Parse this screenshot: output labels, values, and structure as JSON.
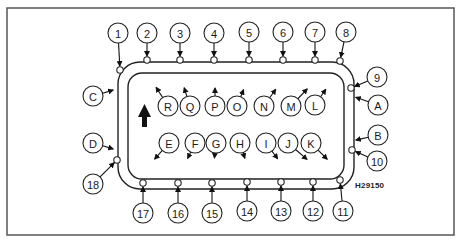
{
  "diagram": {
    "type": "cylinder head / sump bolt tightening sequence",
    "figure_code": "H29150",
    "direction_arrow": "up",
    "outer_numbers": [
      {
        "label": "1",
        "x": 118,
        "y": 33,
        "tx": 120,
        "ty": 70
      },
      {
        "label": "2",
        "x": 147,
        "y": 33,
        "tx": 147,
        "ty": 60
      },
      {
        "label": "3",
        "x": 180,
        "y": 33,
        "tx": 180,
        "ty": 60
      },
      {
        "label": "4",
        "x": 214,
        "y": 33,
        "tx": 214,
        "ty": 60
      },
      {
        "label": "5",
        "x": 249,
        "y": 32,
        "tx": 249,
        "ty": 60
      },
      {
        "label": "6",
        "x": 283,
        "y": 32,
        "tx": 283,
        "ty": 60
      },
      {
        "label": "7",
        "x": 315,
        "y": 32,
        "tx": 315,
        "ty": 60
      },
      {
        "label": "8",
        "x": 346,
        "y": 32,
        "tx": 340,
        "ty": 61
      },
      {
        "label": "9",
        "x": 377,
        "y": 77,
        "tx": 351,
        "ty": 88
      },
      {
        "label": "10",
        "x": 377,
        "y": 161,
        "tx": 352,
        "ty": 150
      },
      {
        "label": "11",
        "x": 343,
        "y": 211,
        "tx": 340,
        "ty": 180
      },
      {
        "label": "12",
        "x": 313,
        "y": 211,
        "tx": 313,
        "ty": 182
      },
      {
        "label": "13",
        "x": 281,
        "y": 211,
        "tx": 281,
        "ty": 182
      },
      {
        "label": "14",
        "x": 247,
        "y": 211,
        "tx": 247,
        "ty": 182
      },
      {
        "label": "15",
        "x": 212,
        "y": 213,
        "tx": 212,
        "ty": 183
      },
      {
        "label": "16",
        "x": 178,
        "y": 213,
        "tx": 178,
        "ty": 183
      },
      {
        "label": "17",
        "x": 143,
        "y": 213,
        "tx": 143,
        "ty": 183
      },
      {
        "label": "18",
        "x": 93,
        "y": 184,
        "tx": 117,
        "ty": 160
      }
    ],
    "inner_letters": [
      {
        "label": "A",
        "x": 378,
        "y": 105,
        "tx": 352,
        "ty": 96
      },
      {
        "label": "B",
        "x": 378,
        "y": 135,
        "tx": 352,
        "ty": 141
      },
      {
        "label": "C",
        "x": 93,
        "y": 96,
        "tx": 117,
        "ty": 89
      },
      {
        "label": "D",
        "x": 93,
        "y": 143,
        "tx": 117,
        "ty": 150
      },
      {
        "label": "E",
        "x": 169,
        "y": 143,
        "tx": 152,
        "ty": 162
      },
      {
        "label": "F",
        "x": 195,
        "y": 143,
        "tx": 186,
        "ty": 162
      },
      {
        "label": "G",
        "x": 216,
        "y": 143,
        "tx": 214,
        "ty": 162
      },
      {
        "label": "H",
        "x": 240,
        "y": 143,
        "tx": 246,
        "ty": 162
      },
      {
        "label": "I",
        "x": 266,
        "y": 143,
        "tx": 280,
        "ty": 162
      },
      {
        "label": "J",
        "x": 288,
        "y": 143,
        "tx": 310,
        "ty": 162
      },
      {
        "label": "K",
        "x": 311,
        "y": 143,
        "tx": 330,
        "ty": 162
      },
      {
        "label": "L",
        "x": 315,
        "y": 105,
        "tx": 328,
        "ty": 86
      },
      {
        "label": "M",
        "x": 291,
        "y": 106,
        "tx": 310,
        "ty": 86
      },
      {
        "label": "N",
        "x": 264,
        "y": 106,
        "tx": 278,
        "ty": 86
      },
      {
        "label": "O",
        "x": 237,
        "y": 106,
        "tx": 245,
        "ty": 86
      },
      {
        "label": "P",
        "x": 215,
        "y": 106,
        "tx": 215,
        "ty": 84
      },
      {
        "label": "Q",
        "x": 190,
        "y": 106,
        "tx": 183,
        "ty": 84
      },
      {
        "label": "R",
        "x": 168,
        "y": 106,
        "tx": 154,
        "ty": 84
      }
    ]
  }
}
